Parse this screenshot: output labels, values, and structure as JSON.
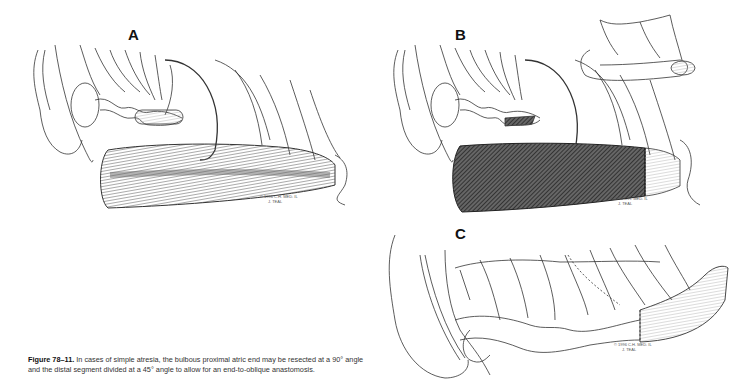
{
  "figure": {
    "panels": [
      {
        "label": "A",
        "signature_line1": "© 1996 C.H. MED. IL",
        "signature_line2": "J. TEAL"
      },
      {
        "label": "B",
        "signature_line1": "© 1996 C.H. MED. IL",
        "signature_line2": "J. TEAL"
      },
      {
        "label": "C",
        "signature_line1": "© 1996 C.H. MED. IL",
        "signature_line2": "J. TEAL"
      }
    ],
    "caption": {
      "number": "Figure 78–11.",
      "text": " In cases of simple atresia, the bulbous proximal atric end may be resected at a 90° angle and the distal segment divided at a 45° angle to allow for an end-to-oblique anastomosis."
    }
  }
}
